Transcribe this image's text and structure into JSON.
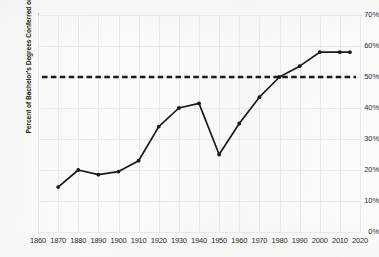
{
  "chart_data": {
    "type": "line",
    "title": "",
    "xlabel": "",
    "ylabel": "Percent of Bachelor's Degrees Conferred on Women",
    "xlim": [
      1860,
      2020
    ],
    "ylim": [
      0,
      70
    ],
    "grid": true,
    "legend": "none",
    "x": [
      1870,
      1880,
      1890,
      1900,
      1910,
      1920,
      1930,
      1940,
      1950,
      1960,
      1970,
      1980,
      1990,
      2000,
      2010,
      2015
    ],
    "values": [
      14.5,
      20.0,
      18.5,
      19.5,
      23.0,
      34.0,
      40.0,
      41.5,
      25.0,
      35.0,
      43.5,
      50.0,
      53.5,
      58.0,
      58.0,
      58.0
    ],
    "series": [
      {
        "name": "Percent of Bachelor's Degrees Conferred on Women",
        "values": [
          14.5,
          20.0,
          18.5,
          19.5,
          23.0,
          34.0,
          40.0,
          41.5,
          25.0,
          35.0,
          43.5,
          50.0,
          53.5,
          58.0,
          58.0,
          58.0
        ],
        "color": "#1a1a1a",
        "marker": "circle"
      }
    ],
    "reference_line": {
      "name": "fifty-percent-parity-line",
      "value": 50,
      "style": "dashed",
      "color": "#1a1a1a"
    },
    "xticks": [
      1860,
      1870,
      1880,
      1890,
      1900,
      1910,
      1920,
      1930,
      1940,
      1950,
      1960,
      1970,
      1980,
      1990,
      2000,
      2010,
      2020
    ],
    "yticks": [
      0,
      10,
      20,
      30,
      40,
      50,
      60,
      70
    ],
    "ytick_labels": [
      "0%",
      "10%",
      "20%",
      "30%",
      "40%",
      "50%",
      "60%",
      "70%"
    ],
    "xtick_labels": [
      "1860",
      "1870",
      "1880",
      "1890",
      "1900",
      "1910",
      "1920",
      "1930",
      "1940",
      "1950",
      "1960",
      "1970",
      "1980",
      "1990",
      "2000",
      "2010",
      "2020"
    ]
  }
}
